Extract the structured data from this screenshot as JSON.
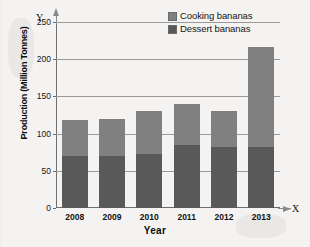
{
  "chart_data": {
    "type": "bar",
    "subtype": "stacked-vertical",
    "title": "",
    "xlabel": "Year",
    "ylabel": "Production (Million Tonnes)",
    "categories": [
      "2008",
      "2009",
      "2010",
      "2011",
      "2012",
      "2013"
    ],
    "series": [
      {
        "name": "Dessert bananas",
        "color": "#595959",
        "values": [
          70,
          70,
          73,
          85,
          82,
          82
        ]
      },
      {
        "name": "Cooking bananas",
        "color": "#808080",
        "values": [
          48,
          50,
          58,
          55,
          48,
          135
        ]
      }
    ],
    "stack_totals": [
      118,
      120,
      131,
      140,
      130,
      217
    ],
    "ylim": [
      0,
      250
    ],
    "yticks": [
      0,
      50,
      100,
      150,
      200,
      250
    ],
    "ytick_labels": [
      "0",
      "50",
      "100",
      "150",
      "200",
      "250"
    ],
    "grid": true,
    "grid_axis": "y",
    "legend_position": "top-right",
    "axis_arrow_labels": {
      "y": "Y",
      "x": "X"
    }
  },
  "legend": {
    "items": [
      {
        "label": "Cooking bananas",
        "color": "#808080"
      },
      {
        "label": "Dessert bananas",
        "color": "#595959"
      }
    ]
  },
  "axes": {
    "y_title": "Production (Million Tonnes)",
    "x_title": "Year",
    "y_letter": "Y",
    "x_letter": "X"
  },
  "colors": {
    "cooking": "#808080",
    "dessert": "#595959",
    "grid": "#9a9a9a",
    "axis": "#6f6f6f",
    "background": "#f4f3f1"
  }
}
